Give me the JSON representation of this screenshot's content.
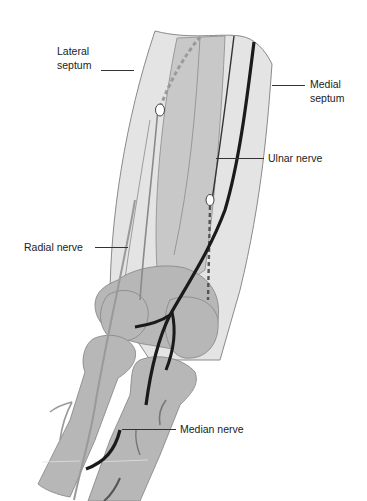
{
  "figure": {
    "colors": {
      "background": "#ffffff",
      "soft_tissue_light": "#e4e4e4",
      "muscle_mid": "#c8c8c8",
      "bone": "#b7b7b7",
      "outline": "#8a8a8a",
      "nerve_dark": "#1a1a1a",
      "radial_nerve_gray": "#9a9a9a",
      "label_text": "#222222"
    }
  },
  "labels": {
    "lateral_septum": {
      "line1": "Lateral",
      "line2": "septum"
    },
    "medial_septum": {
      "line1": "Medial",
      "line2": "septum"
    },
    "ulnar_nerve": "Ulnar nerve",
    "radial_nerve": "Radial nerve",
    "median_nerve": "Median nerve"
  }
}
